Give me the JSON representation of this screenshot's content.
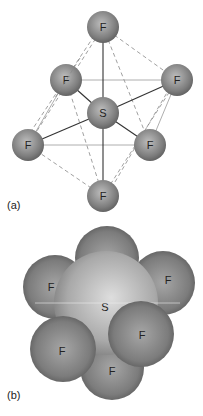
{
  "figure": {
    "panel_a": {
      "label": "(a)",
      "style": "ball-and-stick with dashed octahedron edges",
      "atoms": [
        {
          "id": "F_top",
          "symbol": "F",
          "x": 103,
          "y": 27,
          "r": 16
        },
        {
          "id": "F_ul",
          "symbol": "F",
          "x": 66,
          "y": 80,
          "r": 16
        },
        {
          "id": "F_ur",
          "symbol": "F",
          "x": 177,
          "y": 80,
          "r": 16
        },
        {
          "id": "S",
          "symbol": "S",
          "x": 103,
          "y": 113,
          "r": 16
        },
        {
          "id": "F_ll",
          "symbol": "F",
          "x": 28,
          "y": 145,
          "r": 16
        },
        {
          "id": "F_lr",
          "symbol": "F",
          "x": 150,
          "y": 145,
          "r": 16
        },
        {
          "id": "F_bot",
          "symbol": "F",
          "x": 103,
          "y": 196,
          "r": 16
        }
      ]
    },
    "panel_b": {
      "label": "(b)",
      "style": "space-filling model",
      "atoms": [
        {
          "id": "F_left",
          "symbol": "F",
          "x": 55,
          "y": 287,
          "r": 32
        },
        {
          "id": "F_right",
          "symbol": "F",
          "x": 163,
          "y": 283,
          "r": 32
        },
        {
          "id": "F_bot",
          "symbol": "F",
          "x": 112,
          "y": 368,
          "r": 32
        },
        {
          "id": "F_top",
          "symbol": "F",
          "x": 107,
          "y": 258,
          "r": 32
        },
        {
          "id": "S",
          "symbol": "S",
          "x": 106,
          "y": 303,
          "r": 52
        },
        {
          "id": "F_ll",
          "symbol": "F",
          "x": 63,
          "y": 349,
          "r": 33
        },
        {
          "id": "F_lr",
          "symbol": "F",
          "x": 141,
          "y": 334,
          "r": 33
        }
      ]
    },
    "colors": {
      "atom_dark": "#6a6a6a",
      "atom_light": "#c8c8c8",
      "bond": "#333333",
      "dashed": "#777777"
    }
  }
}
